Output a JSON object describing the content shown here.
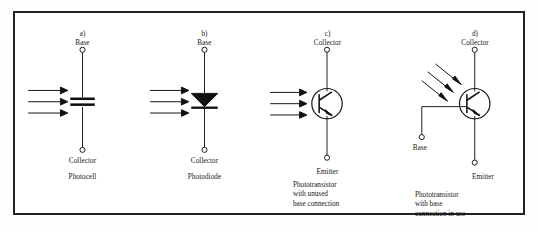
{
  "figure": {
    "background_color": "#ffffff",
    "border_color": "#222222",
    "ink_color": "#161616",
    "panels": [
      {
        "tag": "a)",
        "top_terminal_label": "Base",
        "bottom_terminal_label": "Collector",
        "device_name": "Photocell",
        "symbol": "photocell",
        "light_arrows": 3,
        "light_direction": "horizontal-left-to-right",
        "caption_lines": []
      },
      {
        "tag": "b)",
        "top_terminal_label": "Base",
        "bottom_terminal_label": "Collector",
        "device_name": "Photodiode",
        "symbol": "photodiode",
        "light_arrows": 3,
        "light_direction": "horizontal-left-to-right",
        "caption_lines": []
      },
      {
        "tag": "c)",
        "top_terminal_label": "Collector",
        "bottom_terminal_label": "Emitter",
        "device_name": "Phototransistor",
        "symbol": "phototransistor-no-base",
        "light_arrows": 3,
        "light_direction": "horizontal-left-to-right",
        "caption_lines": [
          "Phototransistor",
          "with unused",
          "base connection"
        ]
      },
      {
        "tag": "d)",
        "top_terminal_label": "Collector",
        "bottom_terminal_label": "Emitter",
        "side_terminal_label": "Base",
        "device_name": "Phototransistor",
        "symbol": "phototransistor-with-base",
        "light_arrows": 3,
        "light_direction": "diagonal-upper-left",
        "caption_lines": [
          "Phototransistor",
          "with base",
          "connection in use"
        ]
      }
    ]
  }
}
